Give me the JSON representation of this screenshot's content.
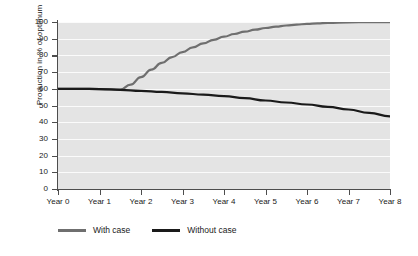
{
  "chart_data": {
    "type": "line",
    "title": "",
    "xlabel": "",
    "ylabel": "Production in % of optimum",
    "categories": [
      "Year 0",
      "Year 1",
      "Year 2",
      "Year 3",
      "Year 4",
      "Year 5",
      "Year 6",
      "Year 7",
      "Year 8"
    ],
    "x": [
      0,
      1,
      2,
      3,
      4,
      5,
      6,
      7,
      8
    ],
    "xlim": [
      0,
      8
    ],
    "ylim": [
      0,
      100
    ],
    "yticks": [
      0,
      10,
      20,
      30,
      40,
      50,
      60,
      70,
      80,
      90,
      100
    ],
    "grid": true,
    "legend_position": "bottom-left",
    "series": [
      {
        "name": "With case",
        "color": "#6f6f6f",
        "points": [
          [
            0.0,
            60.0
          ],
          [
            0.5,
            60.0
          ],
          [
            1.0,
            59.8
          ],
          [
            1.3,
            59.6
          ],
          [
            1.5,
            59.5
          ],
          [
            1.75,
            62.5
          ],
          [
            2.0,
            67.0
          ],
          [
            2.25,
            71.5
          ],
          [
            2.5,
            75.5
          ],
          [
            2.75,
            79.0
          ],
          [
            3.0,
            82.0
          ],
          [
            3.25,
            84.8
          ],
          [
            3.5,
            87.2
          ],
          [
            3.75,
            89.3
          ],
          [
            4.0,
            91.2
          ],
          [
            4.25,
            92.8
          ],
          [
            4.5,
            94.2
          ],
          [
            4.75,
            95.4
          ],
          [
            5.0,
            96.4
          ],
          [
            5.25,
            97.2
          ],
          [
            5.5,
            97.9
          ],
          [
            5.75,
            98.4
          ],
          [
            6.0,
            98.9
          ],
          [
            6.25,
            99.2
          ],
          [
            6.5,
            99.5
          ],
          [
            7.0,
            99.8
          ],
          [
            7.5,
            99.9
          ],
          [
            8.0,
            99.9
          ]
        ]
      },
      {
        "name": "Without case",
        "color": "#1a1a1a",
        "points": [
          [
            0.0,
            60.0
          ],
          [
            0.5,
            60.0
          ],
          [
            1.0,
            59.8
          ],
          [
            1.5,
            59.4
          ],
          [
            2.0,
            58.8
          ],
          [
            2.5,
            58.1
          ],
          [
            3.0,
            57.3
          ],
          [
            3.5,
            56.5
          ],
          [
            4.0,
            55.6
          ],
          [
            4.5,
            54.4
          ],
          [
            5.0,
            53.0
          ],
          [
            5.5,
            51.8
          ],
          [
            6.0,
            50.6
          ],
          [
            6.5,
            49.2
          ],
          [
            7.0,
            47.6
          ],
          [
            7.5,
            45.6
          ],
          [
            8.0,
            43.5
          ]
        ]
      }
    ]
  },
  "legend": {
    "items": [
      {
        "label": "With case",
        "color": "#6f6f6f"
      },
      {
        "label": "Without case",
        "color": "#1a1a1a"
      }
    ]
  }
}
